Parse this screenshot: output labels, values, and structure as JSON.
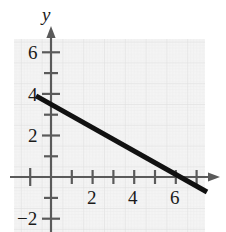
{
  "chart_data": {
    "type": "line",
    "title": "",
    "xlabel": "",
    "ylabel": "y",
    "axis_label_y": "y",
    "xlim": [
      -1.8,
      7.4
    ],
    "ylim": [
      -2.6,
      7.1
    ],
    "grid": true,
    "grid_color": "#ebebeb",
    "grid_style": "fine graph paper",
    "line_color": "#111111",
    "line_width": 5,
    "series": [
      {
        "name": "line",
        "equation": "y = -0.56x + 3.5",
        "slope": -0.56,
        "intercept": 3.5,
        "x_intercept": 6.2,
        "points": [
          {
            "x": -0.72,
            "y": 3.9
          },
          {
            "x": 7.5,
            "y": -0.72
          }
        ]
      }
    ],
    "x_ticks": [
      {
        "value": -1,
        "label": ""
      },
      {
        "value": 1,
        "label": ""
      },
      {
        "value": 2,
        "label": "2"
      },
      {
        "value": 3,
        "label": ""
      },
      {
        "value": 4,
        "label": "4"
      },
      {
        "value": 5,
        "label": ""
      },
      {
        "value": 6,
        "label": "6"
      },
      {
        "value": 7,
        "label": ""
      }
    ],
    "y_ticks": [
      {
        "value": -2,
        "label": "-2"
      },
      {
        "value": -1,
        "label": ""
      },
      {
        "value": 1,
        "label": ""
      },
      {
        "value": 2,
        "label": "2"
      },
      {
        "value": 3,
        "label": ""
      },
      {
        "value": 4,
        "label": "4"
      },
      {
        "value": 5,
        "label": ""
      },
      {
        "value": 6,
        "label": "6"
      },
      {
        "value": 7,
        "label": ""
      }
    ],
    "x_tick_labels": [
      "2",
      "4",
      "6"
    ],
    "y_tick_labels": [
      "6",
      "4",
      "2",
      "-2"
    ],
    "arrows": [
      "x-positive",
      "y-positive"
    ]
  },
  "labels": {
    "y_axis_name": "y",
    "y_6": "6",
    "y_4": "4",
    "y_2": "2",
    "y_neg2": "−2",
    "x_2": "2",
    "x_4": "4",
    "x_6": "6"
  }
}
